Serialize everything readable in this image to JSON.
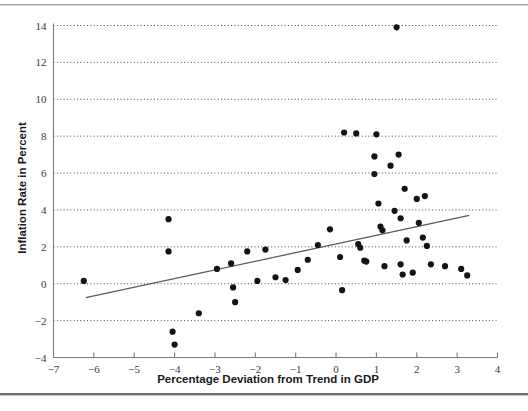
{
  "figure": {
    "background_color": "#ffffff",
    "point_color": "#141414",
    "trendline_color": "#5a5a5a",
    "gridline_color": "#4a4a4a",
    "axis_color": "#7a7a7a"
  },
  "chart_data": {
    "type": "scatter",
    "title": "",
    "xlabel": "Percentage Deviation from Trend in GDP",
    "ylabel": "Inflation Rate in Percent",
    "xlim": [
      -7,
      4
    ],
    "ylim": [
      -4,
      14
    ],
    "xticks": [
      -7,
      -6,
      -5,
      -4,
      -3,
      -2,
      -1,
      0,
      1,
      2,
      3,
      4
    ],
    "xtick_labels": [
      "−7",
      "−6",
      "−5",
      "−4",
      "−3",
      "−2",
      "−1",
      "0",
      "1",
      "2",
      "3",
      "4"
    ],
    "yticks": [
      -4,
      -2,
      0,
      2,
      4,
      6,
      8,
      10,
      12,
      14
    ],
    "ytick_labels": [
      "−4",
      "−2",
      "0",
      "2",
      "4",
      "6",
      "8",
      "10",
      "12",
      "14"
    ],
    "grid": "horizontal-dotted",
    "legend": "none",
    "points": [
      [
        -6.25,
        0.15
      ],
      [
        -4.15,
        3.5
      ],
      [
        -4.15,
        1.75
      ],
      [
        -4.05,
        -2.6
      ],
      [
        -4.0,
        -3.3
      ],
      [
        -3.4,
        -1.6
      ],
      [
        -2.95,
        0.8
      ],
      [
        -2.6,
        1.1
      ],
      [
        -2.55,
        -0.2
      ],
      [
        -2.5,
        -1.0
      ],
      [
        -2.2,
        1.75
      ],
      [
        -1.95,
        0.15
      ],
      [
        -1.75,
        1.85
      ],
      [
        -1.5,
        0.35
      ],
      [
        -1.25,
        0.2
      ],
      [
        -0.95,
        0.75
      ],
      [
        -0.7,
        1.3
      ],
      [
        -0.45,
        2.1
      ],
      [
        -0.15,
        2.95
      ],
      [
        0.1,
        1.45
      ],
      [
        0.15,
        -0.35
      ],
      [
        0.2,
        8.2
      ],
      [
        0.5,
        8.15
      ],
      [
        0.55,
        2.15
      ],
      [
        0.6,
        1.95
      ],
      [
        0.7,
        1.25
      ],
      [
        0.75,
        1.2
      ],
      [
        0.95,
        6.9
      ],
      [
        0.95,
        5.95
      ],
      [
        1.0,
        8.1
      ],
      [
        1.05,
        4.35
      ],
      [
        1.1,
        3.1
      ],
      [
        1.15,
        2.9
      ],
      [
        1.2,
        0.95
      ],
      [
        1.35,
        6.4
      ],
      [
        1.45,
        3.95
      ],
      [
        1.5,
        13.9
      ],
      [
        1.55,
        7.0
      ],
      [
        1.6,
        3.55
      ],
      [
        1.6,
        1.05
      ],
      [
        1.65,
        0.5
      ],
      [
        1.7,
        5.15
      ],
      [
        1.75,
        2.35
      ],
      [
        1.9,
        0.6
      ],
      [
        2.0,
        4.6
      ],
      [
        2.05,
        3.3
      ],
      [
        2.15,
        2.5
      ],
      [
        2.2,
        4.75
      ],
      [
        2.25,
        2.05
      ],
      [
        2.35,
        1.05
      ],
      [
        2.7,
        0.95
      ],
      [
        3.1,
        0.8
      ],
      [
        3.25,
        0.45
      ]
    ],
    "trendline": {
      "x_start": -6.2,
      "y_start": -0.75,
      "x_end": 3.3,
      "y_end": 3.7
    }
  }
}
